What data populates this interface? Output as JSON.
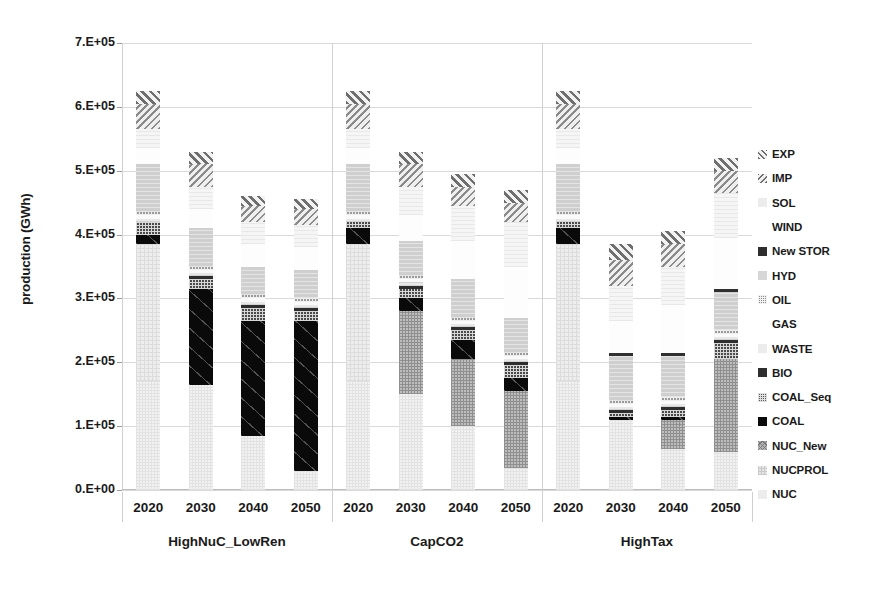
{
  "axis": {
    "y_title": "production (GWh)",
    "y_ticks": [
      "7.E+05",
      "6.E+05",
      "5.E+05",
      "4.E+05",
      "3.E+05",
      "2.E+05",
      "1.E+05",
      "0.E+00"
    ],
    "y_tick_values": [
      700000,
      600000,
      500000,
      400000,
      300000,
      200000,
      100000,
      0
    ],
    "group_labels": [
      "HighNuC_LowRen",
      "CapCO2",
      "HighTax"
    ],
    "year_labels": [
      "2020",
      "2030",
      "2040",
      "2050"
    ]
  },
  "legend": {
    "items": [
      {
        "label": "EXP",
        "swatch": "hatch-diag-dark"
      },
      {
        "label": "IMP",
        "swatch": "hatch-diag-back"
      },
      {
        "label": "SOL",
        "swatch": "solid-vlight"
      },
      {
        "label": "WIND",
        "swatch": "solid-white"
      },
      {
        "label": "New STOR",
        "swatch": "solid-dark"
      },
      {
        "label": "HYD",
        "swatch": "solid-light"
      },
      {
        "label": "OIL",
        "swatch": "checker-dark"
      },
      {
        "label": "GAS",
        "swatch": "solid-white"
      },
      {
        "label": "WASTE",
        "swatch": "solid-vlight"
      },
      {
        "label": "BIO",
        "swatch": "solid-dark"
      },
      {
        "label": "COAL_Seq",
        "swatch": "checker-mid"
      },
      {
        "label": "COAL",
        "swatch": "solid-black"
      },
      {
        "label": "NUC_New",
        "swatch": "cross-mid"
      },
      {
        "label": "NUCPROL",
        "swatch": "dots-light"
      },
      {
        "label": "NUC",
        "swatch": "solid-vlight"
      }
    ]
  },
  "chart_data": {
    "type": "bar",
    "stacked": true,
    "title": "",
    "xlabel": "",
    "ylabel": "production (GWh)",
    "ylim": [
      0,
      700000
    ],
    "ytick_step": 100000,
    "grid": true,
    "legend_position": "right",
    "groups": [
      "HighNuC_LowRen",
      "CapCO2",
      "HighTax"
    ],
    "categories": [
      "HighNuC_LowRen 2020",
      "HighNuC_LowRen 2030",
      "HighNuC_LowRen 2040",
      "HighNuC_LowRen 2050",
      "CapCO2 2020",
      "CapCO2 2030",
      "CapCO2 2040",
      "CapCO2 2050",
      "HighTax 2020",
      "HighTax 2030",
      "HighTax 2040",
      "HighTax 2050"
    ],
    "series": [
      {
        "name": "NUC",
        "values": [
          170000,
          165000,
          85000,
          30000,
          170000,
          150000,
          100000,
          35000,
          170000,
          110000,
          65000,
          60000
        ]
      },
      {
        "name": "NUCPROL",
        "values": [
          215000,
          0,
          0,
          0,
          215000,
          0,
          0,
          0,
          215000,
          0,
          0,
          0
        ]
      },
      {
        "name": "NUC_New",
        "values": [
          0,
          0,
          0,
          0,
          0,
          130000,
          105000,
          120000,
          0,
          0,
          45000,
          145000
        ]
      },
      {
        "name": "COAL",
        "values": [
          15000,
          150000,
          180000,
          235000,
          25000,
          20000,
          30000,
          20000,
          25000,
          5000,
          5000,
          0
        ]
      },
      {
        "name": "COAL_Seq",
        "values": [
          20000,
          15000,
          20000,
          15000,
          10000,
          15000,
          15000,
          20000,
          10000,
          5000,
          10000,
          25000
        ]
      },
      {
        "name": "BIO",
        "values": [
          0,
          5000,
          5000,
          5000,
          0,
          5000,
          5000,
          5000,
          0,
          5000,
          5000,
          5000
        ]
      },
      {
        "name": "WASTE",
        "values": [
          5000,
          5000,
          5000,
          5000,
          5000,
          5000,
          5000,
          5000,
          5000,
          5000,
          5000,
          5000
        ]
      },
      {
        "name": "GAS",
        "values": [
          5000,
          5000,
          5000,
          5000,
          5000,
          5000,
          5000,
          5000,
          5000,
          5000,
          5000,
          5000
        ]
      },
      {
        "name": "OIL",
        "values": [
          5000,
          5000,
          5000,
          5000,
          5000,
          5000,
          5000,
          5000,
          5000,
          5000,
          5000,
          5000
        ]
      },
      {
        "name": "HYD",
        "values": [
          75000,
          60000,
          45000,
          45000,
          75000,
          55000,
          60000,
          55000,
          75000,
          70000,
          65000,
          60000
        ]
      },
      {
        "name": "New STOR",
        "values": [
          0,
          0,
          0,
          0,
          0,
          0,
          0,
          0,
          0,
          5000,
          5000,
          5000
        ]
      },
      {
        "name": "WIND",
        "values": [
          25000,
          30000,
          35000,
          35000,
          25000,
          40000,
          60000,
          80000,
          25000,
          50000,
          75000,
          80000
        ]
      },
      {
        "name": "SOL",
        "values": [
          30000,
          35000,
          35000,
          35000,
          30000,
          45000,
          55000,
          70000,
          30000,
          55000,
          60000,
          70000
        ]
      },
      {
        "name": "IMP",
        "values": [
          40000,
          35000,
          25000,
          25000,
          40000,
          35000,
          30000,
          30000,
          40000,
          40000,
          35000,
          35000
        ]
      },
      {
        "name": "EXP",
        "values": [
          20000,
          20000,
          15000,
          15000,
          20000,
          20000,
          20000,
          20000,
          20000,
          25000,
          20000,
          20000
        ]
      }
    ],
    "totals": [
      625000,
      530000,
      460000,
      485000,
      625000,
      530000,
      495000,
      470000,
      625000,
      380000,
      405000,
      535000
    ]
  }
}
